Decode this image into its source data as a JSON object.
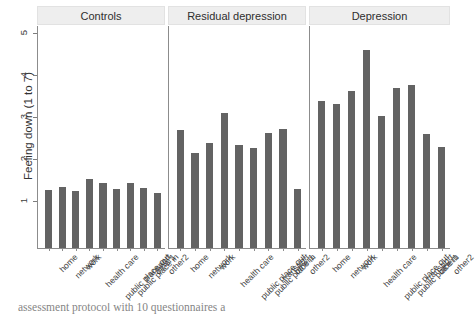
{
  "chart_data": {
    "type": "bar",
    "title": "",
    "xlabel": "",
    "ylabel": "Feeling down (1 to 7)",
    "ylim": [
      0.1,
      5.3
    ],
    "yticks": [
      1,
      2,
      3,
      4,
      5
    ],
    "ytick_labels": [
      "1",
      "2",
      "3",
      "4",
      "5"
    ],
    "grid": false,
    "legend": "none",
    "bar_color": "#636363",
    "strip_background": "#eeeeee",
    "categories": [
      "home",
      "network",
      "work",
      "health care",
      "public place out",
      "public place in",
      "transport",
      "other1",
      "other2"
    ],
    "panels": [
      {
        "label": "Controls",
        "values": [
          1.26,
          1.34,
          1.23,
          1.52,
          1.43,
          1.29,
          1.42,
          1.32,
          1.18
        ]
      },
      {
        "label": "Residual depression",
        "values": [
          2.68,
          2.15,
          2.39,
          3.1,
          2.33,
          2.26,
          2.63,
          2.72,
          1.29
        ]
      },
      {
        "label": "Depression",
        "values": [
          3.39,
          3.31,
          3.62,
          4.59,
          3.02,
          3.69,
          3.76,
          2.6,
          2.28
        ]
      }
    ]
  },
  "caption": {
    "text": "assessment protocol with 10 questionnaires a"
  }
}
